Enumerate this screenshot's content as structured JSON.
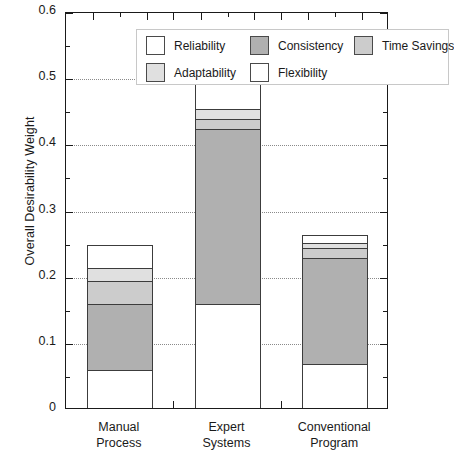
{
  "chart_data": {
    "type": "bar",
    "subtype": "stacked-bar",
    "title": "",
    "xlabel": "",
    "ylabel": "Overall Desirability Weight",
    "categories": [
      "Manual Process",
      "Expert Systems",
      "Conventional Program"
    ],
    "category_labels_wrapped": [
      [
        "Manual",
        "Process"
      ],
      [
        "Expert",
        "Systems"
      ],
      [
        "Conventional",
        "Program"
      ]
    ],
    "series": [
      {
        "name": "Reliability",
        "color": "#ffffff",
        "values": [
          0.06,
          0.16,
          0.07
        ]
      },
      {
        "name": "Consistency",
        "color": "#b0b0b0",
        "values": [
          0.1,
          0.265,
          0.16
        ]
      },
      {
        "name": "Time Savings",
        "color": "#cccccc",
        "values": [
          0.035,
          0.015,
          0.015
        ]
      },
      {
        "name": "Adaptability",
        "color": "#e0e0e0",
        "values": [
          0.02,
          0.015,
          0.008
        ]
      },
      {
        "name": "Flexibility",
        "color": "#ffffff",
        "values": [
          0.035,
          0.045,
          0.012
        ]
      }
    ],
    "totals": [
      0.25,
      0.5,
      0.265
    ],
    "ylim": [
      0,
      0.6
    ],
    "ytick_labels": [
      "0",
      "0.1",
      "0.2",
      "0.3",
      "0.4",
      "0.5",
      "0.6"
    ],
    "ytick_values": [
      0,
      0.1,
      0.2,
      0.3,
      0.4,
      0.5,
      0.6
    ],
    "yminor_step": 0.05,
    "grid": {
      "horizontal": true,
      "style": "dotted",
      "at": [
        0.1,
        0.2,
        0.3,
        0.4,
        0.5
      ]
    },
    "legend": {
      "position": "top-inside",
      "rows": [
        [
          "Reliability",
          "Consistency",
          "Time Savings"
        ],
        [
          "Adaptability",
          "Flexibility"
        ]
      ],
      "entries": [
        {
          "label": "Reliability",
          "color": "#ffffff"
        },
        {
          "label": "Consistency",
          "color": "#b0b0b0"
        },
        {
          "label": "Time Savings",
          "color": "#cccccc"
        },
        {
          "label": "Adaptability",
          "color": "#e0e0e0"
        },
        {
          "label": "Flexibility",
          "color": "#ffffff"
        }
      ]
    },
    "colors": {
      "axis": "#1a1a1a",
      "grid": "#8a8a8a",
      "bar_edge": "#3c3c3c",
      "background": "#ffffff"
    }
  }
}
